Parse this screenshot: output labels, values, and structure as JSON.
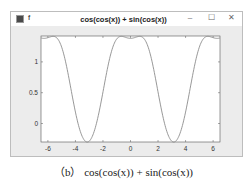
{
  "window": {
    "title": "f",
    "buttons": {
      "minimize": "–",
      "maximize": "☐",
      "close": "✕"
    }
  },
  "chart_data": {
    "type": "line",
    "title": "cos(cos(x)) + sin(cos(x))",
    "xlabel": "",
    "ylabel": "",
    "xlim": [
      -6.5,
      6.5
    ],
    "ylim": [
      -0.3,
      1.42
    ],
    "xticks": [
      -6,
      -4,
      -2,
      0,
      2,
      4,
      6
    ],
    "yticks": [
      0,
      0.5,
      1
    ],
    "grid": false,
    "series": [
      {
        "name": "cos(cos(x)) + sin(cos(x))",
        "color": "#8c8c8c",
        "x": [
          -6.5,
          -6,
          -5.5,
          -5,
          -4.5,
          -4,
          -3.5,
          -3.14,
          -3,
          -2.5,
          -2,
          -1.5,
          -1,
          -0.5,
          0,
          0.5,
          1,
          1.5,
          2,
          2.5,
          3,
          3.14,
          3.5,
          4,
          4.5,
          5,
          5.5,
          6,
          6.5
        ],
        "y": [
          1.38,
          1.38,
          1.4,
          1.23,
          0.83,
          0.38,
          -0.17,
          -0.3,
          -0.29,
          -0.16,
          0.5,
          1.07,
          1.37,
          1.4,
          1.38,
          1.4,
          1.37,
          1.07,
          0.5,
          -0.16,
          -0.29,
          -0.3,
          -0.17,
          0.38,
          0.83,
          1.23,
          1.4,
          1.38,
          1.38
        ]
      }
    ]
  },
  "caption": "（b） cos(cos(x)) + sin(cos(x))"
}
